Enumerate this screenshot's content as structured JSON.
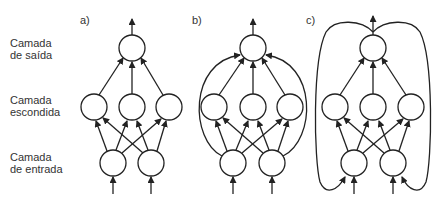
{
  "layer_labels": {
    "output": [
      "Camada",
      "de saída"
    ],
    "hidden": [
      "Camada",
      "escondida"
    ],
    "input": [
      "Camada",
      "de entrada"
    ]
  },
  "panels": [
    {
      "tag": "a)",
      "description": "Feedforward network: 2 inputs, 3 hidden, 1 output"
    },
    {
      "tag": "b)",
      "description": "Feedforward with skip connections from inputs directly to output"
    },
    {
      "tag": "c)",
      "description": "Recurrent network: output fed back into inputs"
    }
  ],
  "colors": {
    "stroke": "#222222",
    "text": "#333333",
    "background": "#ffffff"
  }
}
